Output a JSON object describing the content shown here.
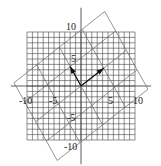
{
  "chart_data": {
    "type": "diagram",
    "title": "",
    "axes": {
      "x_range": [
        -10,
        10
      ],
      "y_range": [
        -10,
        10
      ],
      "x_ticks": [
        "-10",
        "-5",
        "5",
        "10"
      ],
      "y_ticks": [
        "10",
        "5",
        "-5",
        "-10"
      ],
      "grid_step": 1
    },
    "rotated_grid": {
      "basis_a": [
        4.2,
        3.3
      ],
      "basis_b": [
        -2.0,
        3.6
      ],
      "span": [
        -2,
        2
      ]
    },
    "vectors": [
      {
        "name": "v1",
        "from": [
          0,
          0
        ],
        "to": [
          4.2,
          3.3
        ]
      },
      {
        "name": "v2",
        "from": [
          0,
          0
        ],
        "to": [
          -2.0,
          3.6
        ]
      }
    ]
  },
  "labels": {
    "x_neg10": "-10",
    "x_neg5": "-5",
    "x_pos5": "5",
    "x_pos10": "10",
    "y_pos10": "10",
    "y_pos5": "5",
    "y_neg5": "-5",
    "y_neg10": "-10"
  },
  "colors": {
    "grid": "#444444",
    "rotated_grid": "#666666",
    "vector": "#111111"
  }
}
